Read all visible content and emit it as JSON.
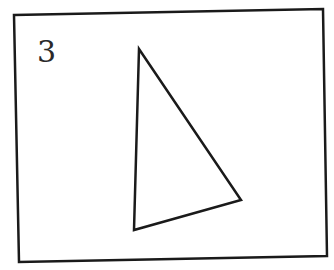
{
  "figure": {
    "label": "3",
    "frame": {
      "points": [
        [
          14,
          15
        ],
        [
          323,
          9
        ],
        [
          327,
          256
        ],
        [
          19,
          262
        ]
      ],
      "stroke": "#1a1a1a",
      "stroke_width": 2.5
    },
    "triangle": {
      "vertices": [
        [
          139,
          49
        ],
        [
          241,
          200
        ],
        [
          134,
          230
        ]
      ],
      "stroke": "#1a1a1a",
      "stroke_width": 2.5,
      "fill": "none"
    }
  }
}
